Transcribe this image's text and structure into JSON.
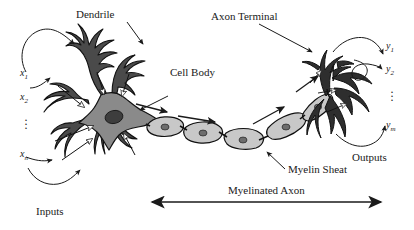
{
  "figure": {
    "type": "biological-neuron-diagram",
    "background_color": "#ffffff",
    "ink_color": "#1a1a1a",
    "soma_fill": "#8a8a8a",
    "myelin_fill": "#c8c8c8",
    "nucleus_fill": "#3d3d3d",
    "dendrite_fill": "#4a4a4a"
  },
  "callouts": {
    "dendrite": "Dendrile",
    "cell_body": "Cell Body",
    "axon_terminal": "Axon Terminal",
    "myelin_sheath": "Myelin Sheat"
  },
  "groups": {
    "inputs": "Inputs",
    "outputs": "Outputs",
    "myelinated_axon": "Myelinated Axon"
  },
  "inputs": {
    "items": [
      {
        "base": "x",
        "sub": "1"
      },
      {
        "base": "x",
        "sub": "2"
      },
      {
        "base": "x",
        "sub": "n"
      }
    ],
    "ellipsis": "⋮"
  },
  "outputs": {
    "items": [
      {
        "base": "y",
        "sub": "1"
      },
      {
        "base": "y",
        "sub": "2"
      },
      {
        "base": "y",
        "sub": "m"
      }
    ],
    "ellipsis": "⋮"
  }
}
